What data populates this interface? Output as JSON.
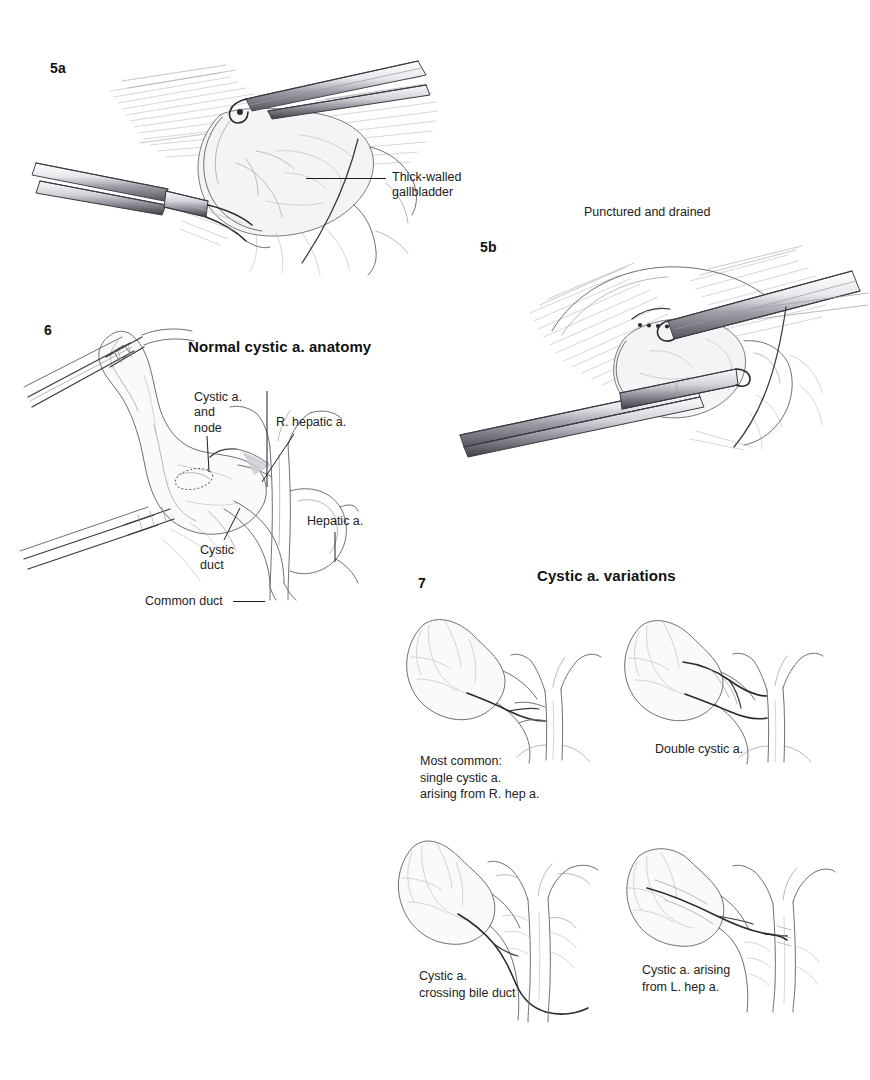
{
  "page": {
    "background": "#ffffff",
    "ink": "#1a1a1a"
  },
  "figures": [
    {
      "id": "fig-5a",
      "number": "5a",
      "title": "",
      "callouts": [
        {
          "name": "thick-walled-gallbladder",
          "text": "Thick-walled\ngallbladder"
        }
      ]
    },
    {
      "id": "fig-5b",
      "number": "5b",
      "title": "Punctured and drained",
      "callouts": []
    },
    {
      "id": "fig-6",
      "number": "6",
      "title": "Normal cystic a. anatomy",
      "callouts": [
        {
          "name": "cystic-a-and-node",
          "text": "Cystic a.\nand\nnode"
        },
        {
          "name": "r-hepatic-a",
          "text": "R. hepatic a."
        },
        {
          "name": "hepatic-a",
          "text": "Hepatic a."
        },
        {
          "name": "cystic-duct",
          "text": "Cystic\nduct"
        },
        {
          "name": "common-duct",
          "text": "Common duct"
        }
      ]
    },
    {
      "id": "fig-7",
      "number": "7",
      "title": "Cystic a. variations",
      "variants": [
        {
          "name": "most-common-single-cystic-a",
          "caption": "Most common:\nsingle cystic a.\narising from R. hep a."
        },
        {
          "name": "double-cystic-a",
          "caption": "Double cystic a."
        },
        {
          "name": "cystic-a-crossing-bile-duct",
          "caption": "Cystic a.\ncrossing bile duct"
        },
        {
          "name": "cystic-a-arising-from-l-hep-a",
          "caption": "Cystic a. arising\nfrom L. hep a."
        }
      ]
    }
  ],
  "labels": {
    "fig5a_number": "5a",
    "fig5a_callout": "Thick-walled\ngallbladder",
    "fig5b_number": "5b",
    "fig5b_title": "Punctured and drained",
    "fig6_number": "6",
    "fig6_title": "Normal cystic a. anatomy",
    "fig6_cystic_node": "Cystic a.\nand\nnode",
    "fig6_r_hepatic": "R. hepatic a.",
    "fig6_hepatic": "Hepatic a.",
    "fig6_cystic_duct": "Cystic\nduct",
    "fig6_common_duct": "Common duct",
    "fig7_number": "7",
    "fig7_title": "Cystic a. variations",
    "fig7_cap1": "Most common:\nsingle cystic a.\narising from R. hep a.",
    "fig7_cap2": "Double cystic a.",
    "fig7_cap3": "Cystic a.\ncrossing bile duct",
    "fig7_cap4": "Cystic a. arising\nfrom L. hep a."
  }
}
